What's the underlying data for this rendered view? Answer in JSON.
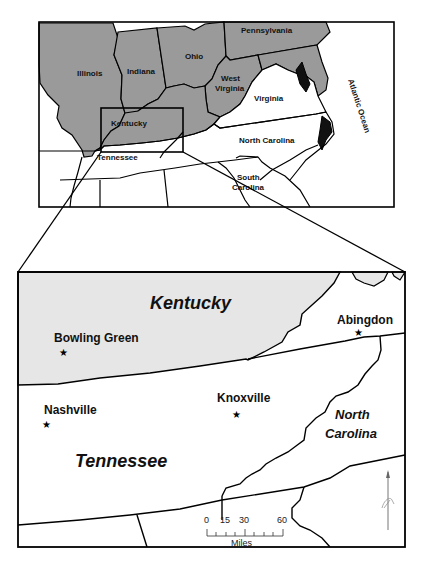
{
  "overview_map": {
    "states": {
      "pennsylvania": "Pennsylvania",
      "ohio": "Ohio",
      "indiana": "Indiana",
      "illinois": "Illinois",
      "west_virginia_line1": "West",
      "west_virginia_line2": "Virginia",
      "virginia": "Virginia",
      "kentucky": "Kentucky",
      "tennessee": "Tennessee",
      "north_carolina": "North Carolina",
      "south_carolina_line1": "South",
      "south_carolina_line2": "Carolina"
    },
    "water": {
      "atlantic": "Atlantic Ocean"
    },
    "colors": {
      "shaded_states": "#9a9a9a",
      "unshaded": "#ffffff",
      "border": "#000000"
    }
  },
  "inset_map": {
    "states": {
      "kentucky": "Kentucky",
      "tennessee": "Tennessee",
      "north_carolina_line1": "North",
      "north_carolina_line2": "Carolina"
    },
    "cities": [
      {
        "name": "Bowling Green"
      },
      {
        "name": "Abingdon"
      },
      {
        "name": "Nashville"
      },
      {
        "name": "Knoxville"
      }
    ],
    "colors": {
      "kentucky_fill": "#e6e6e6"
    }
  },
  "scale_bar": {
    "ticks": [
      "0",
      "15",
      "30",
      "60"
    ],
    "unit": "Miles"
  },
  "north_arrow": {
    "label": "N"
  }
}
